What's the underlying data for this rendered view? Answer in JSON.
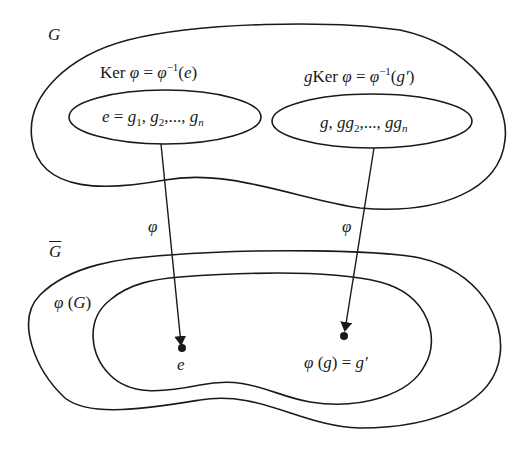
{
  "diagram": {
    "type": "set-mapping",
    "set_G": {
      "label": "G",
      "subsets": [
        {
          "title": "Ker φ = φ⁻¹(e)",
          "title_parts": {
            "a": "Ker ",
            "b": "φ",
            "c": " = ",
            "d": "φ",
            "e": "−1",
            "f": "(",
            "g": "e",
            "h": ")"
          },
          "contents": "e = g₁, g₂,..., gₙ",
          "content_parts": {
            "a": "e",
            "b": " = ",
            "c": "g",
            "c1": "1",
            "d": ", ",
            "e": "g",
            "e1": "2",
            "f": ",..., ",
            "g": "g",
            "g1": "n"
          }
        },
        {
          "title": "gKer φ = φ⁻¹(g′)",
          "title_parts": {
            "a": "g",
            "b": "Ker ",
            "c": "φ",
            "d": " = ",
            "e": "φ",
            "f": "−1",
            "g": "(",
            "h": "g′",
            "i": ")"
          },
          "contents": "g, gg₂,..., ggₙ",
          "content_parts": {
            "a": "g",
            "b": ", ",
            "c": "gg",
            "c1": "2",
            "d": ",..., ",
            "e": "gg",
            "e1": "n"
          }
        }
      ]
    },
    "set_G_bar": {
      "label": "Ḡ",
      "label_base": "G",
      "image_subset": {
        "label": "φ (G)",
        "parts": {
          "a": "φ",
          "b": " (",
          "c": "G",
          "d": ")"
        }
      },
      "points": [
        {
          "label": "e"
        },
        {
          "label": "φ (g) = g′",
          "parts": {
            "a": "φ",
            "b": " (",
            "c": "g",
            "d": ") = ",
            "e": "g′"
          }
        }
      ]
    },
    "arrows": [
      {
        "from": "Ker φ",
        "to": "e",
        "label": "φ"
      },
      {
        "from": "gKer φ",
        "to": "φ(g) = g′",
        "label": "φ"
      }
    ]
  }
}
